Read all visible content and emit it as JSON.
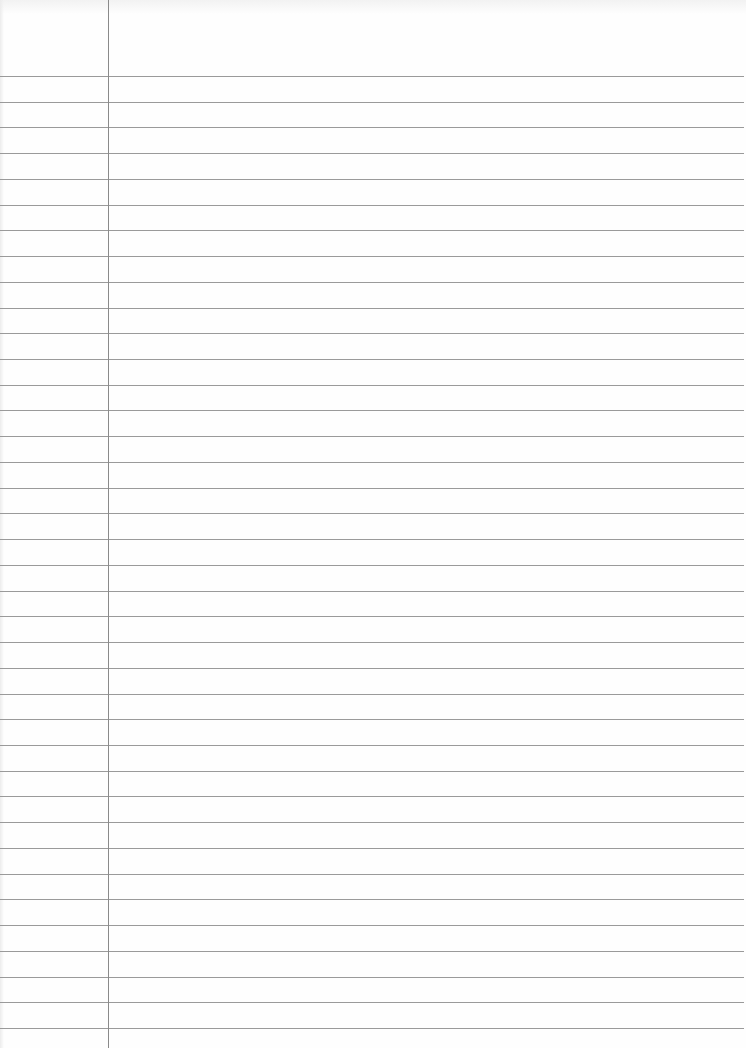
{
  "page": {
    "type": "ruled notebook page",
    "rule_color": "#9a9a9a",
    "margin_color": "#8a8a8a",
    "background": "#fefefe",
    "first_rule_y": 76,
    "rule_spacing": 25.73,
    "rule_count": 38,
    "margin_x": 108
  }
}
